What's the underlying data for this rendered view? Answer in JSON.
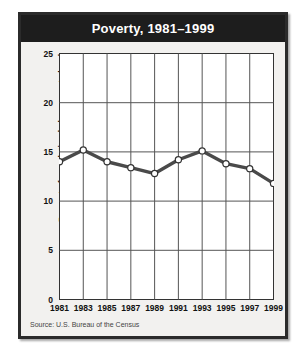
{
  "figure": {
    "title": "Poverty, 1981–1999",
    "source_note": "Source: U.S. Bureau of the Census",
    "colors": {
      "title_bar_background": "#1d1d1d",
      "title_text": "#ffffff",
      "panel_background": "#f2f1ef",
      "frame_border": "#2b2b2b",
      "plot_background": "#ffffff",
      "grid_line": "#555555",
      "axis_line": "#222222",
      "series_line": "#4a4a4a",
      "marker_fill": "#ffffff",
      "marker_edge": "#333333"
    }
  },
  "chart_data": {
    "type": "line",
    "title": "Poverty, 1981–1999",
    "xlabel": "",
    "ylabel": "Percent of population below poverty level",
    "categories": [
      "1981",
      "1983",
      "1985",
      "1987",
      "1989",
      "1991",
      "1993",
      "1995",
      "1997",
      "1999"
    ],
    "x": [
      1981,
      1983,
      1985,
      1987,
      1989,
      1991,
      1993,
      1995,
      1997,
      1999
    ],
    "values": [
      14.0,
      15.2,
      14.0,
      13.4,
      12.8,
      14.2,
      15.1,
      13.8,
      13.3,
      11.8
    ],
    "series": [
      {
        "name": "Percent of population below poverty level",
        "values": [
          14.0,
          15.2,
          14.0,
          13.4,
          12.8,
          14.2,
          15.1,
          13.8,
          13.3,
          11.8
        ]
      }
    ],
    "ylim": [
      0,
      25
    ],
    "yticks": [
      0,
      5,
      10,
      15,
      20,
      25
    ],
    "ytick_labels": [
      "0",
      "5",
      "10",
      "15",
      "20",
      "25"
    ],
    "xtick_labels": [
      "1981",
      "1983",
      "1985",
      "1987",
      "1989",
      "1991",
      "1993",
      "1995",
      "1997",
      "1999"
    ],
    "grid": true,
    "legend": "none",
    "marker": "open-circle",
    "annotations": []
  }
}
